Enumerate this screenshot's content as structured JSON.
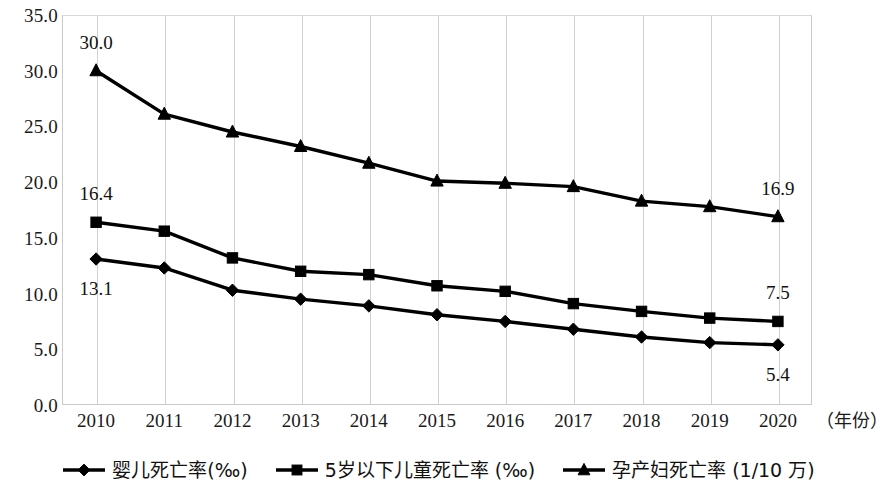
{
  "chart_data": {
    "type": "line",
    "title": "",
    "xlabel": "（年份）",
    "ylabel": "",
    "categories": [
      "2010",
      "2011",
      "2012",
      "2013",
      "2014",
      "2015",
      "2016",
      "2017",
      "2018",
      "2019",
      "2020"
    ],
    "ylim": [
      0,
      35
    ],
    "ytick_step": 5,
    "ytick_labels": [
      "35.0",
      "30.0",
      "25.0",
      "20.0",
      "15.0",
      "10.0",
      "5.0",
      "0.0"
    ],
    "ytick_values": [
      35,
      30,
      25,
      20,
      15,
      10,
      5,
      0
    ],
    "grid": "vertical",
    "legend_position": "bottom",
    "series": [
      {
        "name": "婴儿死亡率(‰)",
        "marker": "diamond",
        "color": "#000000",
        "values": [
          13.1,
          12.3,
          10.3,
          9.5,
          8.9,
          8.1,
          7.5,
          6.8,
          6.1,
          5.6,
          5.4
        ],
        "labels": [
          {
            "index": 0,
            "text": "13.1",
            "position": "below"
          },
          {
            "index": 10,
            "text": "5.4",
            "position": "below"
          }
        ]
      },
      {
        "name": "5岁以下儿童死亡率 (‰)",
        "marker": "square",
        "color": "#000000",
        "values": [
          16.4,
          15.6,
          13.2,
          12.0,
          11.7,
          10.7,
          10.2,
          9.1,
          8.4,
          7.8,
          7.5
        ],
        "labels": [
          {
            "index": 0,
            "text": "16.4",
            "position": "above"
          },
          {
            "index": 10,
            "text": "7.5",
            "position": "above"
          }
        ]
      },
      {
        "name": "孕产妇死亡率 (1/10 万)",
        "marker": "triangle",
        "color": "#000000",
        "values": [
          30.0,
          26.1,
          24.5,
          23.2,
          21.7,
          20.1,
          19.9,
          19.6,
          18.3,
          17.8,
          16.9
        ],
        "labels": [
          {
            "index": 0,
            "text": "30.0",
            "position": "above"
          },
          {
            "index": 10,
            "text": "16.9",
            "position": "above"
          }
        ]
      }
    ]
  },
  "legend": {
    "items": [
      {
        "label": "婴儿死亡率(‰)",
        "marker": "diamond"
      },
      {
        "label": "5岁以下儿童死亡率 (‰)",
        "marker": "square"
      },
      {
        "label": "孕产妇死亡率 (1/10 万)",
        "marker": "triangle"
      }
    ]
  }
}
